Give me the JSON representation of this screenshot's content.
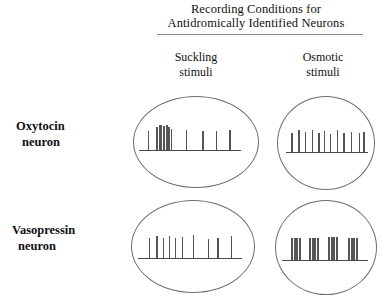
{
  "header": {
    "line1": "Recording Conditions for",
    "line2": "Antidromically Identified Neurons"
  },
  "columns": [
    {
      "id": "suckling",
      "line1": "Suckling",
      "line2": "stimuli"
    },
    {
      "id": "osmotic",
      "line1": "Osmotic",
      "line2": "stimuli"
    }
  ],
  "rows": [
    {
      "id": "oxytocin",
      "line1": "Oxytocin",
      "line2": "neuron"
    },
    {
      "id": "vasopressin",
      "line1": "Vasopressin",
      "line2": "neuron"
    }
  ],
  "colors": {
    "background": "#ffffff",
    "text": "#111111",
    "circle_stroke": "#6e6e6e",
    "baseline": "#4a4a4a",
    "spike": "#555555",
    "header_rule": "#8b8b8b"
  },
  "chart_data": {
    "type": "raster",
    "title": "Recording Conditions for Antidromically Identified Neurons",
    "row_categories": [
      "Oxytocin neuron",
      "Vasopressin neuron"
    ],
    "column_categories": [
      "Suckling stimuli",
      "Osmotic stimuli"
    ],
    "panels": [
      {
        "id": "oxy-suckling",
        "row": "Oxytocin neuron",
        "column": "Suckling stimuli",
        "pattern": "burst",
        "annotation": "Single isolated spike followed by a dense high-frequency burst, then widely spaced low-frequency spikes",
        "baseline": {
          "x_start_pct": 4,
          "x_end_pct": 86
        },
        "spikes": [
          {
            "x_pct": 11,
            "height_pct": 62,
            "width_px": 1.4
          },
          {
            "x_pct": 18,
            "height_pct": 78,
            "width_px": 1.8
          },
          {
            "x_pct": 20.5,
            "height_pct": 82,
            "width_px": 2.6
          },
          {
            "x_pct": 23,
            "height_pct": 80,
            "width_px": 2.6
          },
          {
            "x_pct": 25.5,
            "height_pct": 84,
            "width_px": 2.2
          },
          {
            "x_pct": 27.5,
            "height_pct": 76,
            "width_px": 2.2
          },
          {
            "x_pct": 29.5,
            "height_pct": 70,
            "width_px": 1.8
          },
          {
            "x_pct": 42,
            "height_pct": 66,
            "width_px": 1.4
          },
          {
            "x_pct": 55,
            "height_pct": 64,
            "width_px": 1.4
          },
          {
            "x_pct": 66,
            "height_pct": 62,
            "width_px": 1.4
          },
          {
            "x_pct": 77,
            "height_pct": 66,
            "width_px": 1.4
          }
        ]
      },
      {
        "id": "oxy-osmotic",
        "row": "Oxytocin neuron",
        "column": "Osmotic stimuli",
        "pattern": "continuous-regular",
        "annotation": "Continuous slow irregular firing; evenly spaced spikes across the record",
        "baseline": {
          "x_start_pct": 8,
          "x_end_pct": 94
        },
        "spikes": [
          {
            "x_pct": 14,
            "height_pct": 62,
            "width_px": 1.4
          },
          {
            "x_pct": 21,
            "height_pct": 72,
            "width_px": 1.4
          },
          {
            "x_pct": 28,
            "height_pct": 66,
            "width_px": 1.4
          },
          {
            "x_pct": 35,
            "height_pct": 74,
            "width_px": 1.4
          },
          {
            "x_pct": 42,
            "height_pct": 64,
            "width_px": 1.4
          },
          {
            "x_pct": 48,
            "height_pct": 70,
            "width_px": 1.4
          },
          {
            "x_pct": 54,
            "height_pct": 60,
            "width_px": 1.4
          },
          {
            "x_pct": 61,
            "height_pct": 72,
            "width_px": 1.4
          },
          {
            "x_pct": 68,
            "height_pct": 64,
            "width_px": 1.4
          },
          {
            "x_pct": 76,
            "height_pct": 68,
            "width_px": 1.4
          },
          {
            "x_pct": 84,
            "height_pct": 62,
            "width_px": 1.4
          },
          {
            "x_pct": 89,
            "height_pct": 66,
            "width_px": 1.4
          }
        ]
      },
      {
        "id": "vas-suckling",
        "row": "Vasopressin neuron",
        "column": "Suckling stimuli",
        "pattern": "continuous-irregular",
        "annotation": "Unchanged continuous firing; a closer group of spikes at the left then progressively wider intervals",
        "baseline": {
          "x_start_pct": 5,
          "x_end_pct": 90
        },
        "spikes": [
          {
            "x_pct": 14,
            "height_pct": 68,
            "width_px": 1.4
          },
          {
            "x_pct": 20,
            "height_pct": 72,
            "width_px": 1.4
          },
          {
            "x_pct": 25,
            "height_pct": 66,
            "width_px": 1.4
          },
          {
            "x_pct": 30,
            "height_pct": 74,
            "width_px": 1.4
          },
          {
            "x_pct": 35,
            "height_pct": 68,
            "width_px": 1.4
          },
          {
            "x_pct": 41,
            "height_pct": 70,
            "width_px": 1.4
          },
          {
            "x_pct": 50,
            "height_pct": 76,
            "width_px": 1.4
          },
          {
            "x_pct": 62,
            "height_pct": 64,
            "width_px": 1.4
          },
          {
            "x_pct": 70,
            "height_pct": 66,
            "width_px": 1.4
          },
          {
            "x_pct": 81,
            "height_pct": 74,
            "width_px": 1.4
          }
        ]
      },
      {
        "id": "vas-osmotic",
        "row": "Vasopressin neuron",
        "column": "Osmotic stimuli",
        "pattern": "phasic-bursting",
        "annotation": "Phasic bursting; four discrete dense bursts separated by silent periods",
        "baseline": {
          "x_start_pct": 6,
          "x_end_pct": 92
        },
        "spikes": [
          {
            "x_pct": 15,
            "height_pct": 74,
            "width_px": 2.2
          },
          {
            "x_pct": 17.5,
            "height_pct": 74,
            "width_px": 2.2
          },
          {
            "x_pct": 20,
            "height_pct": 74,
            "width_px": 2.2
          },
          {
            "x_pct": 22.5,
            "height_pct": 74,
            "width_px": 2.2
          },
          {
            "x_pct": 33,
            "height_pct": 74,
            "width_px": 2.2
          },
          {
            "x_pct": 35.5,
            "height_pct": 74,
            "width_px": 2.2
          },
          {
            "x_pct": 38,
            "height_pct": 74,
            "width_px": 2.2
          },
          {
            "x_pct": 40.5,
            "height_pct": 74,
            "width_px": 2.2
          },
          {
            "x_pct": 52,
            "height_pct": 76,
            "width_px": 2.2
          },
          {
            "x_pct": 54.5,
            "height_pct": 76,
            "width_px": 2.2
          },
          {
            "x_pct": 57,
            "height_pct": 76,
            "width_px": 2.2
          },
          {
            "x_pct": 59.5,
            "height_pct": 76,
            "width_px": 2.2
          },
          {
            "x_pct": 72,
            "height_pct": 74,
            "width_px": 2.2
          },
          {
            "x_pct": 74.5,
            "height_pct": 74,
            "width_px": 2.2
          },
          {
            "x_pct": 77,
            "height_pct": 74,
            "width_px": 2.2
          },
          {
            "x_pct": 79.5,
            "height_pct": 74,
            "width_px": 2.2
          }
        ]
      }
    ]
  }
}
